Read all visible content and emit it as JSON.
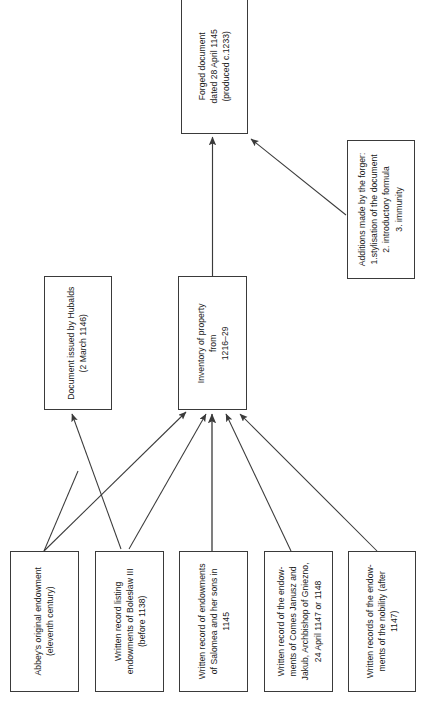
{
  "diagram": {
    "orientation": "bottom-up",
    "text_rotation": "-90deg",
    "colors": {
      "background": "#ffffff",
      "box_border": "#3a3a3a",
      "text": "#1a1a1a",
      "arrow": "#3a3a3a"
    },
    "nodes": [
      {
        "id": "forged",
        "label": "Forged document\ndated 28 April 1145\n(produced c.1233)",
        "role": "result"
      },
      {
        "id": "additions",
        "label": "Additions made by the forger:\n1.stylisation of the document\n2. introductory formula\n3. immunity",
        "role": "annotation"
      },
      {
        "id": "hubalds",
        "label": "Document issued by Hubalds\n(2 March 1146)",
        "role": "intermediate"
      },
      {
        "id": "inventory",
        "label": "Inventory of property\nfrom\n1216–29",
        "role": "intermediate"
      },
      {
        "id": "src1",
        "label": "Abbey's original endowment\n(eleventh century)",
        "role": "source"
      },
      {
        "id": "src2",
        "label": "Written record listing\nendowments of Bolesław III\n(before 1138)",
        "role": "source"
      },
      {
        "id": "src3",
        "label": "Written record of endowments\nof Salomea and her sons in\n1145",
        "role": "source"
      },
      {
        "id": "src4",
        "label": "Written record of the endow-\nments of Comes Janusz and\nJakub, Archbishop of Gniezno,\n24 April 1147 or 1148",
        "role": "source"
      },
      {
        "id": "src5",
        "label": "Written records of the endow-\nments of the nobility (after\n1147)",
        "role": "source"
      }
    ],
    "edges": [
      {
        "from": "inventory",
        "to": "forged",
        "kind": "arrow"
      },
      {
        "from": "additions",
        "to": "forged",
        "kind": "arrow"
      },
      {
        "from": "src1",
        "to": "inventory",
        "kind": "arrow"
      },
      {
        "from": "src2",
        "to": "hubalds",
        "kind": "arrow"
      },
      {
        "from": "src2",
        "to": "inventory",
        "kind": "arrow"
      },
      {
        "from": "src3",
        "to": "inventory",
        "kind": "arrow"
      },
      {
        "from": "src4",
        "to": "inventory",
        "kind": "arrow"
      },
      {
        "from": "src5",
        "to": "inventory",
        "kind": "arrow"
      },
      {
        "from": "src1",
        "to": "hubalds",
        "kind": "line"
      }
    ]
  }
}
